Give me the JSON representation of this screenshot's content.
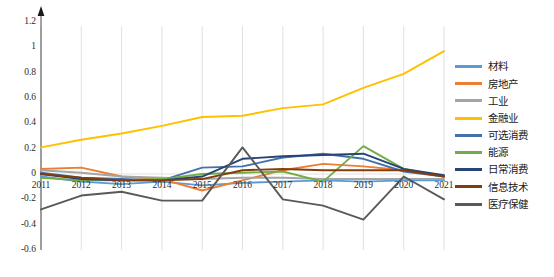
{
  "chart_data": {
    "type": "line",
    "title": "",
    "subtitle": "",
    "xlabel": "",
    "ylabel": "",
    "x": [
      "2011",
      "2012",
      "2013",
      "2014",
      "2015",
      "2016",
      "2017",
      "2018",
      "2019",
      "2020",
      "2021"
    ],
    "categories": [
      "2011",
      "2012",
      "2013",
      "2014",
      "2015",
      "2016",
      "2017",
      "2018",
      "2019",
      "2020",
      "2021"
    ],
    "ylim": [
      -0.6,
      1.2
    ],
    "xlim": [
      2011,
      2021
    ],
    "yticks": [
      "1.2",
      "1",
      "0.8",
      "0.6",
      "0.4",
      "0.2",
      "0",
      "-0.2",
      "-0.4",
      "-0.6"
    ],
    "ytick_values": [
      1.2,
      1.0,
      0.8,
      0.6,
      0.4,
      0.2,
      0.0,
      -0.2,
      -0.4,
      -0.6
    ],
    "grid": "vertical",
    "legend_position": "right",
    "series": [
      {
        "name": "材料",
        "color": "#5b9bd5",
        "values": [
          -0.02,
          -0.06,
          -0.08,
          -0.06,
          -0.09,
          -0.07,
          -0.06,
          -0.05,
          -0.06,
          -0.05,
          -0.05
        ]
      },
      {
        "name": "房地产",
        "color": "#ed7d31",
        "values": [
          0.04,
          0.05,
          -0.02,
          -0.04,
          -0.13,
          -0.05,
          0.03,
          0.08,
          0.06,
          0.03,
          -0.02
        ]
      },
      {
        "name": "工业",
        "color": "#a5a5a5",
        "values": [
          0.03,
          0.01,
          -0.02,
          -0.03,
          -0.04,
          -0.03,
          -0.03,
          -0.04,
          -0.04,
          -0.04,
          -0.04
        ]
      },
      {
        "name": "金融业",
        "color": "#ffc000",
        "values": [
          0.21,
          0.27,
          0.32,
          0.38,
          0.45,
          0.46,
          0.52,
          0.55,
          0.68,
          0.79,
          0.97
        ]
      },
      {
        "name": "可选消费",
        "color": "#4472a8",
        "values": [
          0.01,
          -0.03,
          -0.04,
          -0.05,
          0.05,
          0.06,
          0.13,
          0.16,
          0.12,
          0.02,
          -0.02
        ]
      },
      {
        "name": "能源",
        "color": "#70ad47",
        "values": [
          -0.03,
          -0.05,
          -0.05,
          -0.04,
          0.0,
          0.01,
          0.02,
          -0.06,
          0.22,
          0.04,
          -0.02
        ]
      },
      {
        "name": "日常消费",
        "color": "#264478",
        "values": [
          0.0,
          -0.04,
          -0.05,
          -0.05,
          -0.02,
          0.12,
          0.14,
          0.15,
          0.16,
          0.04,
          -0.01
        ]
      },
      {
        "name": "信息技术",
        "color": "#843c0c",
        "values": [
          0.0,
          -0.03,
          -0.05,
          -0.05,
          -0.04,
          0.03,
          0.04,
          0.03,
          0.03,
          0.03,
          -0.02
        ]
      },
      {
        "name": "医疗保健",
        "color": "#595959",
        "values": [
          -0.28,
          -0.17,
          -0.14,
          -0.21,
          -0.21,
          0.21,
          -0.2,
          -0.25,
          -0.36,
          -0.02,
          -0.2
        ]
      }
    ]
  },
  "footer": {
    "note": ""
  }
}
